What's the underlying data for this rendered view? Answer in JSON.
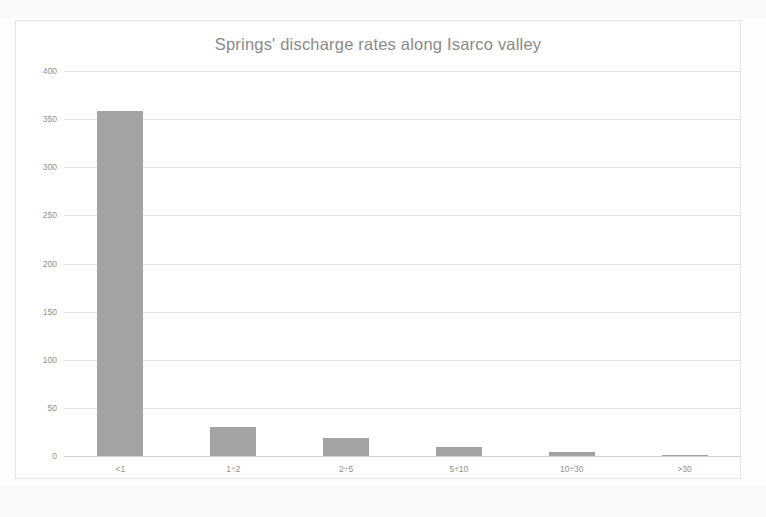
{
  "chart_data": {
    "type": "bar",
    "title": "Springs' discharge rates along Isarco valley",
    "xlabel": "",
    "ylabel": "",
    "categories": [
      "<1",
      "1÷2",
      "2÷5",
      "5÷10",
      "10÷30",
      ">30"
    ],
    "values": [
      358,
      30,
      19,
      9,
      4,
      1
    ],
    "ylim": [
      0,
      400
    ],
    "yticks": [
      0,
      50,
      100,
      150,
      200,
      250,
      300,
      350,
      400
    ],
    "ytick_labels": [
      "0",
      "50",
      "100",
      "150",
      "200",
      "250",
      "300",
      "350",
      "400"
    ],
    "grid": true,
    "legend": false,
    "legend_position": "none",
    "series": [
      {
        "name": "Number of springs",
        "values": [
          358,
          30,
          19,
          9,
          4,
          1
        ]
      }
    ],
    "colors": {
      "bar": "#a3a3a3",
      "gridline": "#e3e3e3",
      "axis_text": "#8f8f8f",
      "title_text": "#8a8a8a",
      "frame": "#e6e6e6",
      "background": "#ffffff"
    }
  }
}
